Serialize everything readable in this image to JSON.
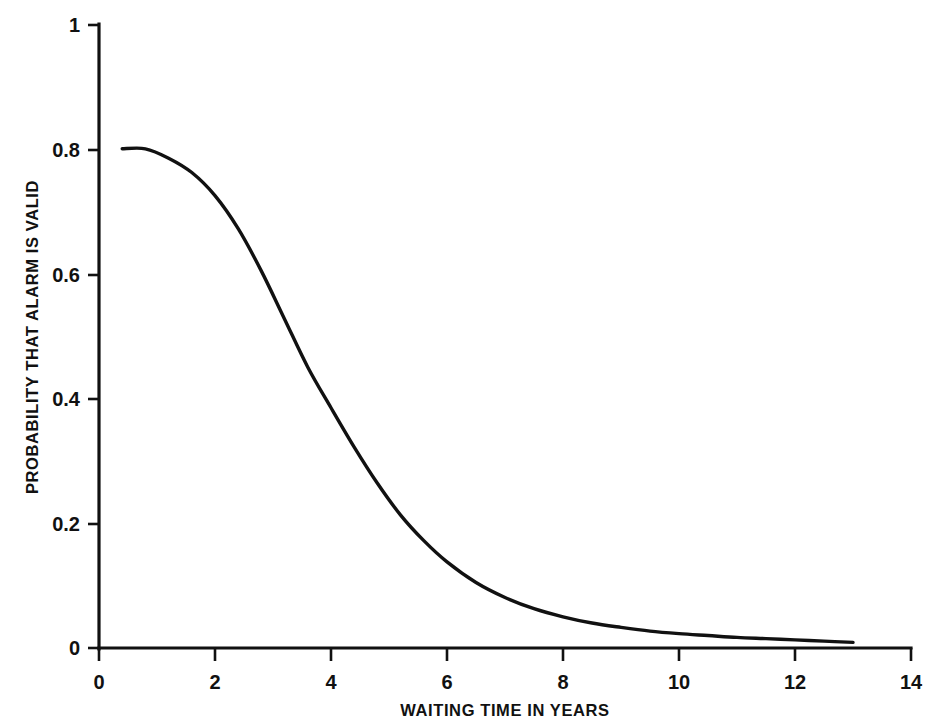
{
  "chart_data": {
    "type": "line",
    "title": "",
    "subtitle": "",
    "xlabel": "WAITING TIME IN YEARS",
    "ylabel": "PROBABILITY THAT ALARM IS VALID",
    "xlim": [
      0,
      14
    ],
    "ylim": [
      0,
      1
    ],
    "grid": false,
    "legend": "none",
    "xticks": [
      0,
      2,
      4,
      6,
      8,
      10,
      12,
      14
    ],
    "xtick_labels": [
      "0",
      "2",
      "4",
      "6",
      "8",
      "10",
      "12",
      "14"
    ],
    "yticks": [
      0,
      0.2,
      0.4,
      0.6,
      0.8,
      1
    ],
    "ytick_labels": [
      "0",
      "0.2",
      "0.4",
      "0.6",
      "0.8",
      "1"
    ],
    "series": [
      {
        "name": "probability-alarm-valid",
        "color": "#111111",
        "x": [
          0.4,
          0.8,
          1.2,
          1.6,
          2.0,
          2.4,
          2.8,
          3.2,
          3.6,
          4.0,
          4.4,
          4.8,
          5.2,
          5.6,
          6.0,
          6.5,
          7.0,
          7.5,
          8.0,
          8.5,
          9.0,
          9.5,
          10.0,
          10.5,
          11.0,
          11.5,
          12.0,
          12.5,
          13.0
        ],
        "values": [
          0.8,
          0.8,
          0.785,
          0.762,
          0.725,
          0.672,
          0.604,
          0.527,
          0.45,
          0.385,
          0.322,
          0.264,
          0.213,
          0.172,
          0.138,
          0.105,
          0.081,
          0.063,
          0.05,
          0.04,
          0.033,
          0.027,
          0.023,
          0.02,
          0.017,
          0.015,
          0.013,
          0.011,
          0.009
        ]
      }
    ]
  },
  "axis_labels": {
    "x_title": "WAITING TIME IN YEARS",
    "y_title": "PROBABILITY THAT ALARM IS VALID"
  },
  "x_tick_labels": [
    "0",
    "2",
    "4",
    "6",
    "8",
    "10",
    "12",
    "14"
  ],
  "y_tick_labels": [
    "1",
    "0.8",
    "0.6",
    "0.4",
    "0.2",
    "0"
  ]
}
